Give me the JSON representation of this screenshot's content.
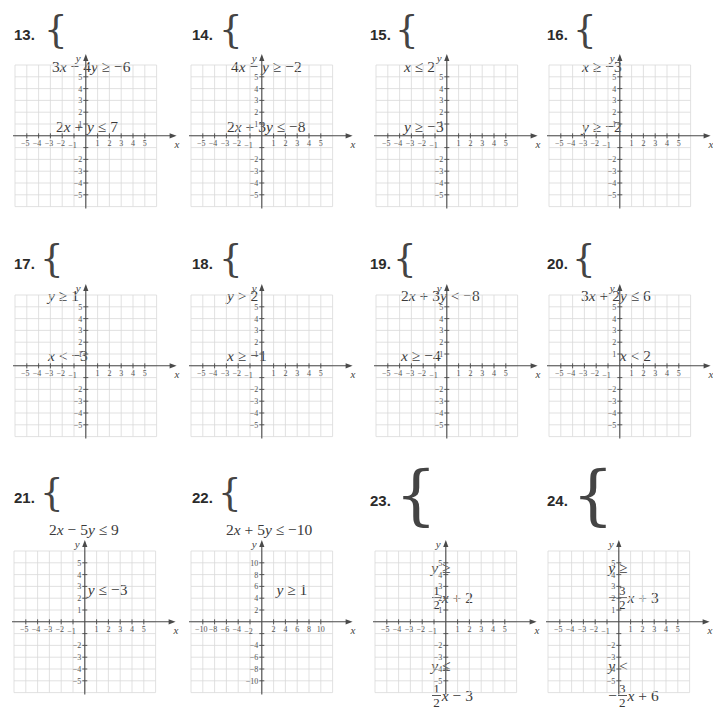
{
  "page": {
    "colors": {
      "grid": "#d9d9d9",
      "axis": "#4a4a4a",
      "text": "#3a3a3a",
      "background": "#ffffff"
    }
  },
  "problems": [
    {
      "number": "13.",
      "lines": [
        "3x − 4y ≥ −6",
        " 2x + y ≤ 7"
      ],
      "graph": {
        "range": 5,
        "step": 1
      }
    },
    {
      "number": "14.",
      "lines": [
        " 4x − y ≥ −2",
        "2x + 3y ≤ −8"
      ],
      "graph": {
        "range": 5,
        "step": 1
      }
    },
    {
      "number": "15.",
      "lines": [
        "x ≤ 2",
        "y ≥ −3"
      ],
      "graph": {
        "range": 5,
        "step": 1
      }
    },
    {
      "number": "16.",
      "lines": [
        "x ≥ −3",
        "y ≥ −2"
      ],
      "graph": {
        "range": 5,
        "step": 1
      }
    },
    {
      "number": "17.",
      "lines": [
        "y ≥ 1",
        "x < −3"
      ],
      "graph": {
        "range": 5,
        "step": 1
      }
    },
    {
      "number": "18.",
      "lines": [
        "y > 2",
        "x ≥ −1"
      ],
      "graph": {
        "range": 5,
        "step": 1
      }
    },
    {
      "number": "19.",
      "lines": [
        "2x + 3y < −8",
        "x ≥ −4"
      ],
      "graph": {
        "range": 5,
        "step": 1
      }
    },
    {
      "number": "20.",
      "lines": [
        "3x + 2y ≤ 6",
        "          x < 2"
      ],
      "graph": {
        "range": 5,
        "step": 1
      }
    },
    {
      "number": "21.",
      "lines": [
        "2x − 5y ≤ 9",
        "          y ≤ −3"
      ],
      "graph": {
        "range": 5,
        "step": 1
      }
    },
    {
      "number": "22.",
      "lines": [
        "2x + 5y ≤ −10",
        "             y ≥ 1"
      ],
      "graph": {
        "range": 10,
        "step": 2
      }
    },
    {
      "number": "23.",
      "frac_lines": [
        {
          "lhs": "y ≥",
          "sign": "",
          "num": "1",
          "den": "2",
          "rhs": "x + 2"
        },
        {
          "lhs": "y ≤",
          "sign": "",
          "num": "1",
          "den": "2",
          "rhs": "x − 3"
        }
      ],
      "graph": {
        "range": 5,
        "step": 1
      }
    },
    {
      "number": "24.",
      "frac_lines": [
        {
          "lhs": "y ≥",
          "sign": "−",
          "num": "3",
          "den": "2",
          "rhs": "x + 3"
        },
        {
          "lhs": "y <",
          "sign": "−",
          "num": "3",
          "den": "2",
          "rhs": "x + 6"
        }
      ],
      "graph": {
        "range": 5,
        "step": 1
      }
    }
  ],
  "axis_labels": {
    "x": "x",
    "y": "y"
  }
}
